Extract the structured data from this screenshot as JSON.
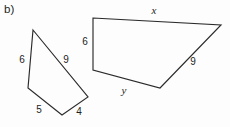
{
  "figure": {
    "part_label": "b)",
    "part_label_pos": {
      "x": 4,
      "y": 4
    },
    "background_color": "#fdfdfd",
    "stroke_color": "#2b2b2b",
    "text_color": "#1e1e1e",
    "width": 230,
    "height": 127,
    "shapes": [
      {
        "name": "left-quadrilateral",
        "points": "33,30 88,97 62,115 28,88",
        "labels": [
          {
            "id": "left-side-6",
            "text": "6",
            "x": 22,
            "y": 60,
            "style": "number"
          },
          {
            "id": "left-side-9",
            "text": "9",
            "x": 66,
            "y": 60,
            "style": "number"
          },
          {
            "id": "left-side-5",
            "text": "5",
            "x": 39,
            "y": 110,
            "style": "number"
          },
          {
            "id": "left-side-4",
            "text": "4",
            "x": 79,
            "y": 112,
            "style": "number"
          }
        ]
      },
      {
        "name": "right-quadrilateral",
        "points": "93,18 221,25 160,88 93,70",
        "labels": [
          {
            "id": "right-side-x",
            "text": "x",
            "x": 154,
            "y": 10,
            "style": "variable"
          },
          {
            "id": "right-side-6",
            "text": "6",
            "x": 85,
            "y": 42,
            "style": "number"
          },
          {
            "id": "right-side-9",
            "text": "9",
            "x": 193,
            "y": 62,
            "style": "number"
          },
          {
            "id": "right-side-y",
            "text": "y",
            "x": 124,
            "y": 90,
            "style": "variable"
          }
        ]
      }
    ]
  }
}
